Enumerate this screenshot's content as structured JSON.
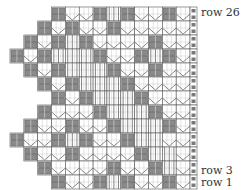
{
  "chart": {
    "rows": 26,
    "band_rows": 2,
    "units": 13,
    "colors": {
      "grid": "#555555",
      "block": "#6e6e6e",
      "block_fill": "#8a8a8a",
      "line": "#666666",
      "edge": "#7a7a7a"
    },
    "bands": [
      {
        "start": 3,
        "blocks": [
          3,
          6,
          8,
          11
        ],
        "lines": [
          7
        ]
      },
      {
        "start": 2,
        "blocks": [
          2,
          4,
          7
        ],
        "lines": []
      },
      {
        "start": 1,
        "blocks": [
          1,
          3,
          5,
          10
        ],
        "lines": [
          4
        ]
      },
      {
        "start": 0,
        "blocks": [
          0,
          2,
          6,
          9,
          11
        ],
        "lines": [
          3,
          4,
          5,
          10
        ]
      },
      {
        "start": 1,
        "blocks": [
          1,
          3,
          7,
          10
        ],
        "lines": [
          4,
          5,
          6
        ]
      },
      {
        "start": 2,
        "blocks": [
          2,
          4,
          8
        ],
        "lines": [
          5,
          6,
          7
        ]
      },
      {
        "start": 3,
        "blocks": [
          3,
          5,
          9
        ],
        "lines": [
          6,
          7,
          8
        ]
      },
      {
        "start": 2,
        "blocks": [
          2,
          6,
          10
        ],
        "lines": [
          7,
          8,
          9
        ]
      },
      {
        "start": 1,
        "blocks": [
          1,
          4,
          7,
          11
        ],
        "lines": [
          8,
          9,
          10
        ]
      },
      {
        "start": 0,
        "blocks": [
          0,
          3,
          5,
          8
        ],
        "lines": [
          4,
          9,
          10
        ]
      },
      {
        "start": 1,
        "blocks": [
          1,
          4,
          9
        ],
        "lines": [
          10,
          11
        ]
      },
      {
        "start": 2,
        "blocks": [
          2,
          7,
          10
        ],
        "lines": [
          11
        ]
      },
      {
        "start": 3,
        "blocks": [
          3,
          6,
          8,
          11
        ],
        "lines": [
          7
        ]
      }
    ]
  },
  "labels": {
    "row_top": "row 26",
    "row_3": "row 3",
    "row_1": "row 1"
  }
}
